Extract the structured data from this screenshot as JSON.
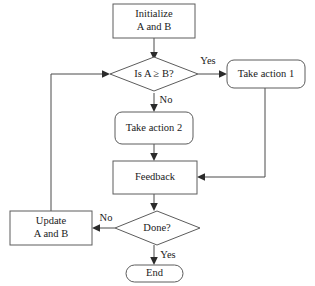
{
  "diagram": {
    "canvas": {
      "width": 315,
      "height": 286,
      "background": "#ffffff"
    },
    "stroke_color": "#5c5c5c",
    "line_color": "#4a4a4a",
    "text_color": "#1a1a1a",
    "nodes": {
      "initialize": {
        "shape": "rectangle",
        "line1": "Initialize",
        "line2": "A and B"
      },
      "decision_compare": {
        "shape": "diamond",
        "label": "Is A ≥ B?"
      },
      "take_action_1": {
        "shape": "rounded-rectangle",
        "label": "Take action 1"
      },
      "take_action_2": {
        "shape": "rounded-rectangle",
        "label": "Take action 2"
      },
      "feedback": {
        "shape": "rectangle",
        "label": "Feedback"
      },
      "decision_done": {
        "shape": "diamond",
        "label": "Done?"
      },
      "update": {
        "shape": "rectangle",
        "line1": "Update",
        "line2": "A and B"
      },
      "end": {
        "shape": "stadium",
        "label": "End"
      }
    },
    "edge_labels": {
      "compare_yes": "Yes",
      "compare_no": "No",
      "done_no": "No",
      "done_yes": "Yes"
    }
  }
}
